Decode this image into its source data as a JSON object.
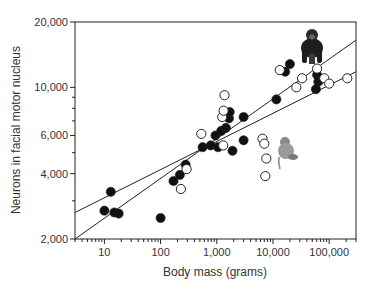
{
  "chart_data": {
    "type": "scatter",
    "title": "",
    "xlabel": "Body mass (grams)",
    "ylabel": "Neurons in facial motor nucleus",
    "xscale": "log",
    "yscale": "log",
    "xlim": [
      3,
      300000
    ],
    "ylim": [
      2000,
      20000
    ],
    "xticks": [
      {
        "value": 10,
        "label": "10"
      },
      {
        "value": 100,
        "label": "100"
      },
      {
        "value": 1000,
        "label": "1,000"
      },
      {
        "value": 10000,
        "label": "10,000"
      },
      {
        "value": 100000,
        "label": "100,000"
      }
    ],
    "yticks": [
      {
        "value": 2000,
        "label": "2,000"
      },
      {
        "value": 4000,
        "label": "4,000"
      },
      {
        "value": 6000,
        "label": "6,000"
      },
      {
        "value": 10000,
        "label": "10,000"
      },
      {
        "value": 20000,
        "label": "20,000"
      }
    ],
    "grid": false,
    "legend": null,
    "series": [
      {
        "name": "filled",
        "marker": "filled-circle",
        "points": [
          [
            10,
            2700
          ],
          [
            13,
            3300
          ],
          [
            15,
            2650
          ],
          [
            18,
            2620
          ],
          [
            100,
            2500
          ],
          [
            170,
            3700
          ],
          [
            220,
            3950
          ],
          [
            280,
            4400
          ],
          [
            560,
            5300
          ],
          [
            780,
            5400
          ],
          [
            950,
            6000
          ],
          [
            1050,
            5300
          ],
          [
            1200,
            6300
          ],
          [
            1450,
            6500
          ],
          [
            1650,
            7200
          ],
          [
            1700,
            7700
          ],
          [
            1900,
            5100
          ],
          [
            3000,
            7300
          ],
          [
            3000,
            5700
          ],
          [
            11500,
            8800
          ],
          [
            16500,
            11800
          ],
          [
            20000,
            12800
          ],
          [
            61000,
            11400
          ],
          [
            58000,
            9800
          ],
          [
            64000,
            10600
          ]
        ]
      },
      {
        "name": "open",
        "marker": "open-circle",
        "points": [
          [
            230,
            3400
          ],
          [
            290,
            4200
          ],
          [
            530,
            6100
          ],
          [
            1250,
            7300
          ],
          [
            1370,
            9200
          ],
          [
            1320,
            7800
          ],
          [
            1300,
            5400
          ],
          [
            6500,
            5800
          ],
          [
            7000,
            5500
          ],
          [
            7600,
            4700
          ],
          [
            7300,
            3900
          ],
          [
            13200,
            12000
          ],
          [
            26000,
            10000
          ],
          [
            33000,
            11000
          ],
          [
            61000,
            12200
          ],
          [
            82000,
            11000
          ],
          [
            100000,
            10400
          ],
          [
            210000,
            11000
          ]
        ]
      }
    ],
    "fit_lines": [
      {
        "name": "steep fit",
        "from": [
          3,
          2000
        ],
        "to": [
          300000,
          16500
        ]
      },
      {
        "name": "shallow fit",
        "from": [
          3,
          2650
        ],
        "to": [
          300000,
          11800
        ]
      }
    ],
    "annotations": [
      {
        "type": "image",
        "depicts": "chimpanzee",
        "position": "upper right"
      },
      {
        "type": "image",
        "depicts": "monkey",
        "position": "right middle"
      }
    ]
  }
}
